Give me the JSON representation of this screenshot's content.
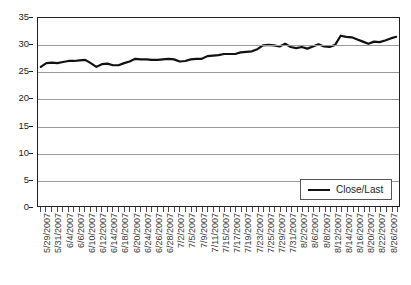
{
  "chart_data": {
    "type": "line",
    "title": "",
    "xlabel": "",
    "ylabel": "",
    "ylim": [
      0,
      35
    ],
    "yticks": [
      0,
      5,
      10,
      15,
      20,
      25,
      30,
      35
    ],
    "grid": true,
    "legend_position": "bottom-right",
    "legend_entries": [
      "Close/Last"
    ],
    "series": [
      {
        "name": "Close/Last",
        "color": "#111111",
        "values": [
          25.9,
          26.6,
          26.7,
          26.6,
          26.8,
          27.0,
          27.0,
          27.1,
          27.2,
          26.6,
          25.9,
          26.4,
          26.5,
          26.2,
          26.2,
          26.6,
          26.9,
          27.4,
          27.3,
          27.3,
          27.2,
          27.2,
          27.3,
          27.4,
          27.3,
          26.9,
          27.0,
          27.3,
          27.4,
          27.4,
          27.9,
          28.0,
          28.1,
          28.3,
          28.3,
          28.3,
          28.6,
          28.7,
          28.8,
          29.2,
          29.9,
          30.0,
          29.9,
          29.7,
          30.2,
          29.6,
          29.4,
          29.6,
          29.3,
          29.7,
          30.1,
          29.7,
          29.6,
          30.0,
          31.7,
          31.5,
          31.4,
          31.0,
          30.6,
          30.2,
          30.6,
          30.5,
          30.8,
          31.2,
          31.5
        ]
      }
    ],
    "categories": [
      "5/29/2007",
      "5/30/2007",
      "5/31/2007",
      "6/1/2007",
      "6/4/2007",
      "6/5/2007",
      "6/6/2007",
      "6/7/2007",
      "6/8/2007",
      "6/11/2007",
      "6/12/2007",
      "6/13/2007",
      "6/14/2007",
      "6/15/2007",
      "6/18/2007",
      "6/19/2007",
      "6/20/2007",
      "6/21/2007",
      "6/22/2007",
      "6/25/2007",
      "6/26/2007",
      "6/27/2007",
      "6/28/2007",
      "6/29/2007",
      "7/2/2007",
      "7/3/2007",
      "7/5/2007",
      "7/6/2007",
      "7/9/2007",
      "7/10/2007",
      "7/11/2007",
      "7/12/2007",
      "7/13/2007",
      "7/16/2007",
      "7/17/2007",
      "7/18/2007",
      "7/19/2007",
      "7/20/2007",
      "7/23/2007",
      "7/24/2007",
      "7/25/2007",
      "7/26/2007",
      "7/27/2007",
      "7/30/2007",
      "7/31/2007",
      "8/1/2007",
      "8/2/2007",
      "8/3/2007",
      "8/6/2007",
      "8/7/2007",
      "8/8/2007",
      "8/9/2007",
      "8/10/2007",
      "8/13/2007",
      "8/14/2007",
      "8/15/2007",
      "8/16/2007",
      "8/17/2007",
      "8/20/2007",
      "8/21/2007",
      "8/22/2007",
      "8/23/2007",
      "8/24/2007",
      "8/27/2007",
      "8/28/2007"
    ],
    "visible_xtick_labels": [
      "5/29/2007",
      "5/31/2007",
      "6/4/2007",
      "6/6/2007",
      "6/10/2007",
      "6/12/2007",
      "6/14/2007",
      "6/18/2007",
      "6/20/2007",
      "6/24/2007",
      "6/26/2007",
      "6/28/2007",
      "7/2/2007",
      "7/5/2007",
      "7/9/2007",
      "7/11/2007",
      "7/15/2007",
      "7/17/2007",
      "7/19/2007",
      "7/23/2007",
      "7/25/2007",
      "7/29/2007",
      "7/31/2007",
      "8/2/2007",
      "8/6/2007",
      "8/8/2007",
      "8/12/2007",
      "8/14/2007",
      "8/16/2007",
      "8/20/2007",
      "8/22/2007",
      "8/26/2007"
    ]
  },
  "legend": {
    "label": "Close/Last"
  }
}
